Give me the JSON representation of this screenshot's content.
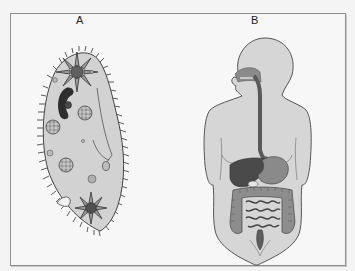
{
  "panels": [
    {
      "id": "A",
      "label": "A",
      "subject": "paramecium"
    },
    {
      "id": "B",
      "label": "B",
      "subject": "human-digestive-system"
    }
  ],
  "colors": {
    "background": "#f7f7f7",
    "border": "#8f8f8f",
    "cell_fill": "#d2d2d2",
    "body_fill": "#d6d6d6",
    "organ_dark": "#505050",
    "organ_mid": "#7a7a7a"
  }
}
